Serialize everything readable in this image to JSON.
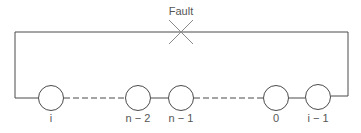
{
  "diagram": {
    "fault_label": "Fault",
    "colors": {
      "line": "#4a4a4a",
      "text": "#555555",
      "fault": "#8a8a8a"
    },
    "nodes": [
      {
        "id": "i",
        "label": "i"
      },
      {
        "id": "n-2",
        "label": "n − 2"
      },
      {
        "id": "n-1",
        "label": "n − 1"
      },
      {
        "id": "0",
        "label": "0"
      },
      {
        "id": "i-1",
        "label": "i − 1"
      }
    ],
    "connections": [
      {
        "from": "i",
        "to": "n-2",
        "style": "dashed"
      },
      {
        "from": "n-2",
        "to": "n-1",
        "style": "solid"
      },
      {
        "from": "n-1",
        "to": "0",
        "style": "dashed"
      },
      {
        "from": "0",
        "to": "i-1",
        "style": "solid"
      },
      {
        "from": "i-1",
        "to": "i",
        "style": "solid",
        "via": "top loop",
        "fault": true
      }
    ]
  }
}
